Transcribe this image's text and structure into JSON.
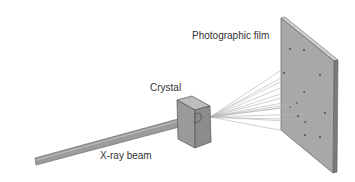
{
  "labels": {
    "film": "Photographic film",
    "crystal": "Crystal",
    "beam": "X-ray beam"
  },
  "colors": {
    "film_face": "#a8a8a8",
    "film_edge": "#7a7a7a",
    "crystal_front": "#9a9a9a",
    "crystal_top": "#b8b8b8",
    "crystal_side": "#8a8a8a",
    "beam": "#9c9c9c",
    "ray": "#aaaaaa",
    "spot": "#444444",
    "text": "#333333"
  }
}
